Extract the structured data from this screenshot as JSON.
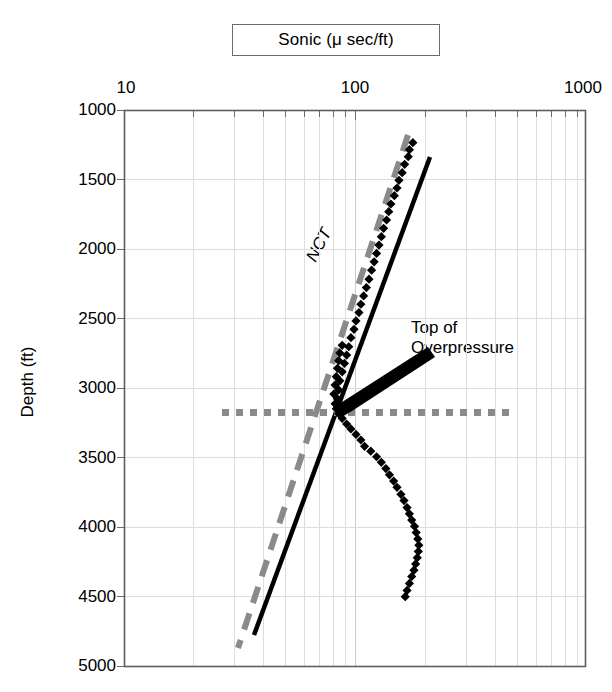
{
  "chart_data": {
    "type": "scatter",
    "title": "Sonic (μ sec/ft)",
    "xlabel": "Sonic (μ sec/ft)",
    "ylabel": "Depth (ft)",
    "xscale": "log",
    "yscale": "linear",
    "xlim": [
      10,
      1000
    ],
    "ylim": [
      1000,
      5000
    ],
    "y_inverted": true,
    "grid": true,
    "legend": "none",
    "xticks": [
      "10",
      "100",
      "1000"
    ],
    "xtick_values": [
      10,
      100,
      1000
    ],
    "yticks": [
      "1000",
      "1500",
      "2000",
      "2500",
      "3000",
      "3500",
      "4000",
      "4500",
      "5000"
    ],
    "ytick_values": [
      1000,
      1500,
      2000,
      2500,
      3000,
      3500,
      4000,
      4500,
      5000
    ],
    "series": [
      {
        "name": "Sonic log data",
        "marker": "diamond",
        "color": "#000000",
        "x_label": "Sonic (μ sec/ft)",
        "y_label": "Depth (ft)",
        "points": [
          [
            178,
            1235
          ],
          [
            172,
            1285
          ],
          [
            170,
            1335
          ],
          [
            164,
            1390
          ],
          [
            160,
            1450
          ],
          [
            155,
            1505
          ],
          [
            152,
            1560
          ],
          [
            148,
            1615
          ],
          [
            143,
            1675
          ],
          [
            140,
            1730
          ],
          [
            137,
            1790
          ],
          [
            133,
            1850
          ],
          [
            130,
            1910
          ],
          [
            127,
            1970
          ],
          [
            124,
            2030
          ],
          [
            121,
            2090
          ],
          [
            118,
            2150
          ],
          [
            115,
            2215
          ],
          [
            112,
            2275
          ],
          [
            109,
            2335
          ],
          [
            106,
            2395
          ],
          [
            104,
            2455
          ],
          [
            101,
            2515
          ],
          [
            99,
            2575
          ],
          [
            96,
            2635
          ],
          [
            88,
            2690
          ],
          [
            94,
            2700
          ],
          [
            86,
            2745
          ],
          [
            92,
            2760
          ],
          [
            85,
            2800
          ],
          [
            90,
            2820
          ],
          [
            84,
            2855
          ],
          [
            88,
            2880
          ],
          [
            83,
            2915
          ],
          [
            86,
            2945
          ],
          [
            82,
            2975
          ],
          [
            85,
            3010
          ],
          [
            81,
            3040
          ],
          [
            84,
            3075
          ],
          [
            82,
            3110
          ],
          [
            83,
            3145
          ],
          [
            85,
            3180
          ],
          [
            88,
            3215
          ],
          [
            92,
            3255
          ],
          [
            96,
            3290
          ],
          [
            101,
            3330
          ],
          [
            106,
            3370
          ],
          [
            110,
            3415
          ],
          [
            117,
            3450
          ],
          [
            124,
            3490
          ],
          [
            130,
            3530
          ],
          [
            136,
            3575
          ],
          [
            141,
            3620
          ],
          [
            147,
            3665
          ],
          [
            152,
            3710
          ],
          [
            158,
            3760
          ],
          [
            163,
            3805
          ],
          [
            168,
            3855
          ],
          [
            172,
            3900
          ],
          [
            176,
            3945
          ],
          [
            181,
            3990
          ],
          [
            184,
            4035
          ],
          [
            187,
            4080
          ],
          [
            189,
            4125
          ],
          [
            188,
            4170
          ],
          [
            186,
            4215
          ],
          [
            183,
            4260
          ],
          [
            180,
            4305
          ],
          [
            176,
            4350
          ],
          [
            172,
            4400
          ],
          [
            168,
            4450
          ],
          [
            165,
            4495
          ]
        ]
      }
    ],
    "trend_lines": [
      {
        "name": "NCT",
        "label": "NCT",
        "style": "dashed",
        "color": "#808080",
        "width_px": 5,
        "from": [
          178,
          1240
        ],
        "to": [
          57,
          4910
        ],
        "description": "Normal compaction trend, gray dashed line through shallow data"
      },
      {
        "name": "fit-line",
        "label": "",
        "style": "solid",
        "color": "#000000",
        "width_px": 4,
        "from": [
          197,
          1345
        ],
        "to": [
          65,
          4790
        ],
        "description": "Solid black reference line"
      }
    ],
    "markers": [
      {
        "name": "top-of-overpressure-line",
        "type": "hline",
        "style": "dotted",
        "color": "#808080",
        "y": 3145,
        "x_from": 36,
        "x_to": 455,
        "width_px": 6
      }
    ],
    "annotations": [
      {
        "name": "top-of-overpressure",
        "text_lines": [
          "Top of",
          "Overpressure"
        ],
        "text": "Top of Overpressure",
        "arrow": true,
        "arrow_tip": [
          97,
          3140
        ],
        "arrow_tail": [
          260,
          2800
        ]
      },
      {
        "name": "nct-label",
        "text": "NCT",
        "rotated": true,
        "angle_deg": -62
      }
    ]
  },
  "axes": {
    "x_title": "Sonic (μ sec/ft)",
    "y_title": "Depth (ft)",
    "x_labels": [
      "10",
      "100",
      "1000"
    ],
    "y_labels": [
      "1000",
      "1500",
      "2000",
      "2500",
      "3000",
      "3500",
      "4000",
      "4500",
      "5000"
    ]
  },
  "labels": {
    "nct": "NCT",
    "overpressure_line1": "Top of",
    "overpressure_line2": "Overpressure"
  },
  "colors": {
    "marker": "#000000",
    "nct_line": "#808080",
    "fit_line": "#000000",
    "overpressure_line": "#808080",
    "frame": "#595959",
    "grid": "#d9d9d9",
    "background": "#ffffff"
  }
}
